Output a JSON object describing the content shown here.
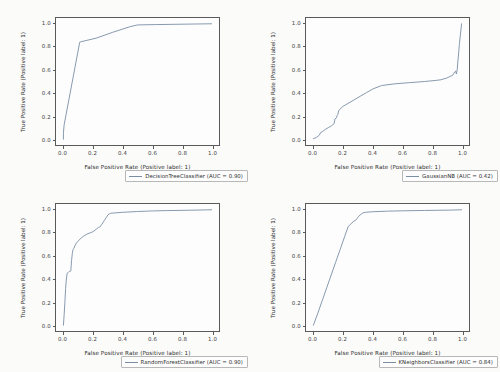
{
  "figure": {
    "layout": "2x2 grid of ROC curve subplots",
    "background_color": "#fbfbfa",
    "curve_color": "#7a8fa6",
    "axis_color": "#5a5a5a"
  },
  "chart_data": [
    {
      "type": "line",
      "title": "",
      "xlabel": "False Positive Rate (Positive label: 1)",
      "ylabel": "True Positive Rate (Positive label: 1)",
      "xlim": [
        -0.05,
        1.05
      ],
      "ylim": [
        -0.05,
        1.05
      ],
      "xticks": [
        "0.0",
        "0.2",
        "0.4",
        "0.6",
        "0.8",
        "1.0"
      ],
      "yticks": [
        "0.0",
        "0.2",
        "0.4",
        "0.6",
        "0.8",
        "1.0"
      ],
      "grid": false,
      "legend_position": "lower right",
      "series": [
        {
          "name": "DecisionTreeClassifier (AUC = 0.90)",
          "estimator": "DecisionTreeClassifier",
          "auc": 0.9,
          "x": [
            0.0,
            0.0,
            0.005,
            0.11,
            0.12,
            0.22,
            0.33,
            0.45,
            0.5,
            0.62,
            0.78,
            1.0
          ],
          "y": [
            0.0,
            0.055,
            0.125,
            0.84,
            0.845,
            0.875,
            0.925,
            0.975,
            0.99,
            0.993,
            0.996,
            1.0
          ]
        }
      ]
    },
    {
      "type": "line",
      "title": "",
      "xlabel": "False Positive Rate (Positive label: 1)",
      "ylabel": "True Positive Rate (Positive label: 1)",
      "xlim": [
        -0.05,
        1.05
      ],
      "ylim": [
        -0.05,
        1.05
      ],
      "xticks": [
        "0.0",
        "0.2",
        "0.4",
        "0.6",
        "0.8",
        "1.0"
      ],
      "yticks": [
        "0.0",
        "0.2",
        "0.4",
        "0.6",
        "0.8",
        "1.0"
      ],
      "grid": false,
      "legend_position": "lower right",
      "series": [
        {
          "name": "GaussianNB (AUC = 0.42)",
          "estimator": "GaussianNB",
          "auc": 0.42,
          "x": [
            0.0,
            0.02,
            0.04,
            0.05,
            0.06,
            0.08,
            0.1,
            0.12,
            0.14,
            0.145,
            0.155,
            0.16,
            0.165,
            0.17,
            0.175,
            0.2,
            0.24,
            0.28,
            0.32,
            0.36,
            0.4,
            0.46,
            0.55,
            0.65,
            0.75,
            0.83,
            0.86,
            0.9,
            0.94,
            0.955,
            0.96,
            0.965,
            0.97,
            0.985,
            1.0
          ],
          "y": [
            0.005,
            0.015,
            0.035,
            0.06,
            0.065,
            0.085,
            0.1,
            0.115,
            0.135,
            0.175,
            0.185,
            0.205,
            0.215,
            0.245,
            0.255,
            0.285,
            0.315,
            0.345,
            0.375,
            0.405,
            0.435,
            0.465,
            0.48,
            0.49,
            0.5,
            0.51,
            0.515,
            0.53,
            0.555,
            0.585,
            0.59,
            0.565,
            0.6,
            0.82,
            1.0
          ]
        }
      ]
    },
    {
      "type": "line",
      "title": "",
      "xlabel": "False Positive Rate (Positive label: 1)",
      "ylabel": "True Positive Rate (Positive label: 1)",
      "xlim": [
        -0.05,
        1.05
      ],
      "ylim": [
        -0.05,
        1.05
      ],
      "xticks": [
        "0.0",
        "0.2",
        "0.4",
        "0.6",
        "0.8",
        "1.0"
      ],
      "yticks": [
        "0.0",
        "0.2",
        "0.4",
        "0.6",
        "0.8",
        "1.0"
      ],
      "grid": false,
      "legend_position": "lower right",
      "series": [
        {
          "name": "RandomForestClassifier (AUC = 0.90)",
          "estimator": "RandomForestClassifier",
          "auc": 0.9,
          "x": [
            0.0,
            0.005,
            0.01,
            0.015,
            0.02,
            0.025,
            0.03,
            0.035,
            0.04,
            0.05,
            0.055,
            0.06,
            0.065,
            0.07,
            0.08,
            0.09,
            0.1,
            0.12,
            0.14,
            0.16,
            0.18,
            0.2,
            0.215,
            0.225,
            0.235,
            0.245,
            0.26,
            0.275,
            0.29,
            0.3,
            0.31,
            0.32,
            0.4,
            0.5,
            0.6,
            0.7,
            0.85,
            1.0
          ],
          "y": [
            0.0,
            0.09,
            0.2,
            0.32,
            0.4,
            0.45,
            0.455,
            0.46,
            0.465,
            0.47,
            0.56,
            0.62,
            0.655,
            0.665,
            0.695,
            0.715,
            0.73,
            0.755,
            0.775,
            0.79,
            0.8,
            0.81,
            0.825,
            0.835,
            0.845,
            0.85,
            0.875,
            0.905,
            0.935,
            0.955,
            0.965,
            0.97,
            0.978,
            0.985,
            0.99,
            0.993,
            0.996,
            1.0
          ]
        }
      ]
    },
    {
      "type": "line",
      "title": "",
      "xlabel": "False Positive Rate (Positive label: 1)",
      "ylabel": "True Positive Rate (Positive label: 1)",
      "xlim": [
        -0.05,
        1.05
      ],
      "ylim": [
        -0.05,
        1.05
      ],
      "xticks": [
        "0.0",
        "0.2",
        "0.4",
        "0.6",
        "0.8",
        "1.0"
      ],
      "yticks": [
        "0.0",
        "0.2",
        "0.4",
        "0.6",
        "0.8",
        "1.0"
      ],
      "grid": false,
      "legend_position": "lower right",
      "series": [
        {
          "name": "KNeighborsClassifier (AUC = 0.84)",
          "estimator": "KNeighborsClassifier",
          "auc": 0.84,
          "x": [
            0.0,
            0.03,
            0.06,
            0.09,
            0.12,
            0.15,
            0.18,
            0.21,
            0.235,
            0.25,
            0.26,
            0.27,
            0.28,
            0.29,
            0.3,
            0.315,
            0.33,
            0.35,
            0.4,
            0.5,
            0.6,
            0.75,
            0.92,
            1.0
          ],
          "y": [
            0.0,
            0.105,
            0.215,
            0.325,
            0.435,
            0.545,
            0.655,
            0.765,
            0.855,
            0.875,
            0.885,
            0.9,
            0.905,
            0.915,
            0.935,
            0.955,
            0.97,
            0.978,
            0.983,
            0.988,
            0.991,
            0.994,
            0.997,
            1.0
          ]
        }
      ]
    }
  ]
}
